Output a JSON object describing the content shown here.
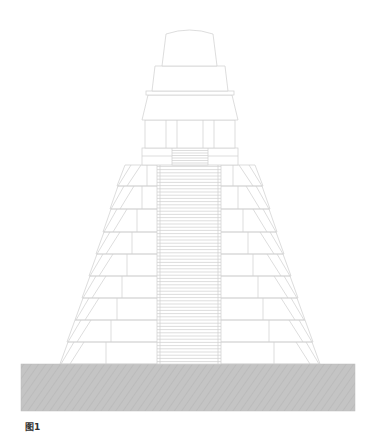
{
  "figure": {
    "caption": "图1",
    "colors": {
      "line": "#cfcfcf",
      "line_dark": "#bdbdbd",
      "ground_fill": "#c4c4c4",
      "ground_hatch": "#b3b3b3",
      "background": "#ffffff"
    },
    "ground": {
      "x": 21,
      "y": 364,
      "width": 334,
      "height": 47
    },
    "pyramid_tiers": [
      {
        "y_top": 342,
        "y_bottom": 364,
        "left_top": 68,
        "left_bottom": 60,
        "right_top": 312,
        "right_bottom": 320
      },
      {
        "y_top": 320,
        "y_bottom": 342,
        "left_top": 75,
        "left_bottom": 67,
        "right_top": 305,
        "right_bottom": 313
      },
      {
        "y_top": 298,
        "y_bottom": 320,
        "left_top": 83,
        "left_bottom": 75,
        "right_top": 297,
        "right_bottom": 305
      },
      {
        "y_top": 276,
        "y_bottom": 298,
        "left_top": 90,
        "left_bottom": 82,
        "right_top": 290,
        "right_bottom": 298
      },
      {
        "y_top": 254,
        "y_bottom": 276,
        "left_top": 97,
        "left_bottom": 89,
        "right_top": 283,
        "right_bottom": 291
      },
      {
        "y_top": 232,
        "y_bottom": 254,
        "left_top": 104,
        "left_bottom": 96,
        "right_top": 276,
        "right_bottom": 284
      },
      {
        "y_top": 209,
        "y_bottom": 232,
        "left_top": 111,
        "left_bottom": 103,
        "right_top": 269,
        "right_bottom": 277
      },
      {
        "y_top": 186,
        "y_bottom": 209,
        "left_top": 118,
        "left_bottom": 110,
        "right_top": 262,
        "right_bottom": 270
      },
      {
        "y_top": 165,
        "y_bottom": 186,
        "left_top": 125,
        "left_bottom": 117,
        "right_top": 255,
        "right_bottom": 263
      }
    ],
    "staircase": {
      "x_left": 157,
      "x_right": 221,
      "y_top": 160,
      "y_bottom": 364,
      "step_spacing": 3.2
    },
    "temple": {
      "platform": {
        "x": 142,
        "y": 148,
        "width": 96,
        "height": 17
      },
      "platform_stairs": {
        "x": 172,
        "y": 148,
        "width": 36,
        "height": 17
      },
      "body": {
        "x": 145,
        "y": 120,
        "width": 90,
        "height": 28,
        "pillars": [
          166,
          177,
          203,
          214
        ]
      },
      "roof_band": {
        "y_top": 95,
        "y_bottom": 120,
        "left_top": 148,
        "left_bottom": 142,
        "right_top": 232,
        "right_bottom": 238
      },
      "ledge": {
        "x": 146,
        "y": 91,
        "width": 88,
        "height": 4
      },
      "upper_block": {
        "y_top": 66,
        "y_bottom": 91,
        "left_top": 155,
        "left_bottom": 152,
        "right_top": 225,
        "right_bottom": 228
      },
      "roof_comb": {
        "y_top": 30,
        "y_bottom": 66,
        "left_top": 166,
        "left_bottom": 162,
        "right_top": 213,
        "right_bottom": 217,
        "arc_height": 4
      }
    }
  }
}
